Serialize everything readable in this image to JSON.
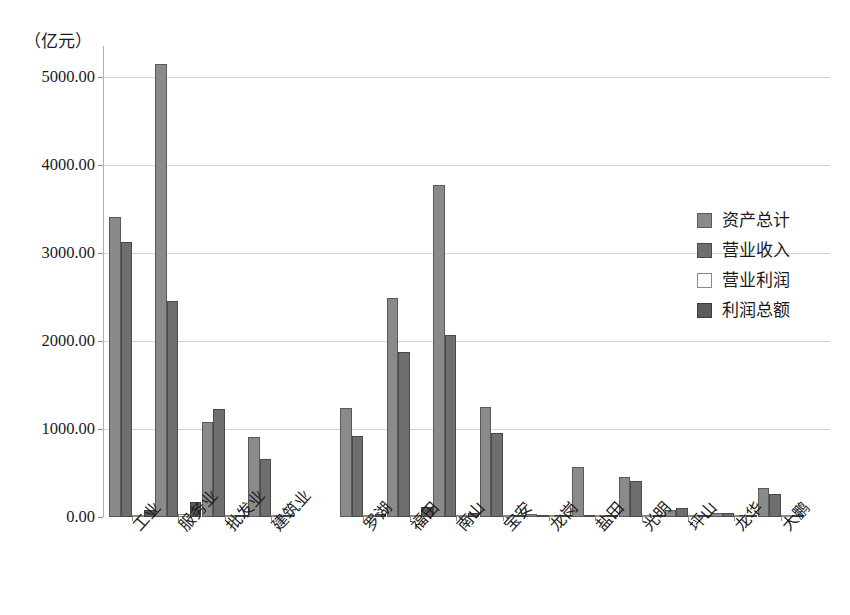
{
  "chart_data": {
    "type": "bar",
    "title": "",
    "subtitle": "",
    "xlabel": "",
    "ylabel": "（亿元）",
    "ylim": [
      0,
      5500
    ],
    "yticks": [
      "0.00",
      "1000.00",
      "2000.00",
      "3000.00",
      "4000.00",
      "5000.00"
    ],
    "ytick_values": [
      0,
      1000,
      2000,
      3000,
      4000,
      5000
    ],
    "grid": true,
    "legend_position": "right",
    "categories": [
      "工业",
      "服务业",
      "批发业",
      "建筑业",
      "罗湖",
      "福田",
      "南山",
      "宝安",
      "龙岗",
      "盐田",
      "光明",
      "坪山",
      "龙华",
      "大鹏"
    ],
    "group_break_after_index": 3,
    "series": [
      {
        "name": "资产总计",
        "color": "#8a8a8a",
        "values": [
          3409,
          5148,
          1080,
          909,
          1239,
          2489,
          3773,
          1250,
          34,
          568,
          455,
          85,
          50,
          330
        ]
      },
      {
        "name": "营业收入",
        "color": "#6f6f6f",
        "values": [
          3125,
          2455,
          1227,
          659,
          920,
          1875,
          2068,
          955,
          23,
          16,
          409,
          102,
          45,
          261
        ]
      },
      {
        "name": "营业利润",
        "color": "#fdfdfd",
        "values": [
          18,
          34,
          11,
          9,
          11,
          14,
          16,
          12,
          5,
          7,
          9,
          6,
          5,
          7
        ]
      },
      {
        "name": "利润总额",
        "color": "#5c5c5c",
        "values": [
          75,
          170,
          23,
          23,
          34,
          114,
          45,
          23,
          11,
          17,
          23,
          11,
          11,
          23
        ]
      }
    ]
  },
  "legend": {
    "items": [
      {
        "label": "资产总计",
        "swatch": "s0"
      },
      {
        "label": "营业收入",
        "swatch": "s1"
      },
      {
        "label": "营业利润",
        "swatch": "s2"
      },
      {
        "label": "利润总额",
        "swatch": "s3"
      }
    ]
  }
}
